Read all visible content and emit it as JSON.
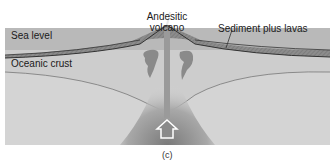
{
  "figure": {
    "caption": "(c)",
    "labels": {
      "sea_level": "Sea level",
      "volcano_line1": "Andesitic",
      "volcano_line2": "volcano",
      "sediment": "Sediment plus lavas",
      "oceanic_crust": "Oceanic crust"
    },
    "icons": {
      "upward_arrow": "up-arrow"
    },
    "colors": {
      "background": "#ffffff",
      "ocean_band": "#b8b8b8",
      "crust": "#cfcfcf",
      "mantle": "#d6d6d6",
      "volcano": "#8f8f8f",
      "magma": "#8a8a8a",
      "line": "#333333"
    }
  }
}
